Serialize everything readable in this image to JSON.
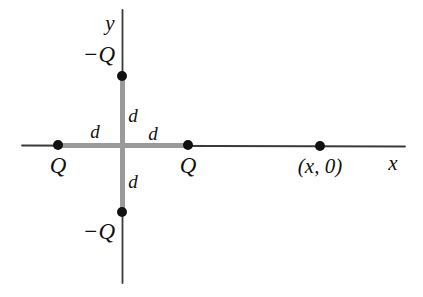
{
  "figure": {
    "type": "physics-diagram",
    "background_color": "#ffffff",
    "axis_color_thin": "#3a3a3a",
    "axis_color_thick": "#9a9a9a",
    "dot_color": "#111111",
    "label_color": "#111111"
  },
  "axes": {
    "x_label": "x",
    "y_label": "y",
    "x_axis_start_px": 22,
    "x_axis_end_px": 405,
    "y_axis_top_px": 10,
    "y_axis_bottom_px": 283,
    "origin_x_px": 122,
    "origin_y_px": 145
  },
  "charges": [
    {
      "id": "charge-left",
      "label": "Q",
      "sign": "positive",
      "x_px": 58,
      "y_px": 145,
      "label_x_px": 58,
      "label_y_px": 165,
      "position": "(-d, 0)"
    },
    {
      "id": "charge-right",
      "label": "Q",
      "sign": "positive",
      "x_px": 188,
      "y_px": 145,
      "label_x_px": 188,
      "label_y_px": 165,
      "position": "(d, 0)"
    },
    {
      "id": "charge-top",
      "label": "−Q",
      "sign": "negative",
      "x_px": 122,
      "y_px": 76,
      "label_x_px": 99,
      "label_y_px": 54,
      "position": "(0, d)"
    },
    {
      "id": "charge-bottom",
      "label": "−Q",
      "sign": "negative",
      "x_px": 122,
      "y_px": 212,
      "label_x_px": 99,
      "label_y_px": 231,
      "position": "(0, -d)"
    }
  ],
  "field_point": {
    "id": "field-point",
    "label": "(x, 0)",
    "x_px": 320,
    "y_px": 146,
    "label_x_px": 320,
    "label_y_px": 166
  },
  "distance_labels": [
    {
      "id": "d-left",
      "label": "d",
      "x_px": 95,
      "y_px": 131
    },
    {
      "id": "d-top",
      "label": "d",
      "x_px": 133,
      "y_px": 115
    },
    {
      "id": "d-right",
      "label": "d",
      "x_px": 153,
      "y_px": 133
    },
    {
      "id": "d-bottom",
      "label": "d",
      "x_px": 133,
      "y_px": 181
    }
  ],
  "thick_segments": [
    {
      "id": "seg-left",
      "from": [
        58,
        145
      ],
      "to": [
        122,
        145
      ]
    },
    {
      "id": "seg-right",
      "from": [
        122,
        145
      ],
      "to": [
        188,
        145
      ]
    },
    {
      "id": "seg-up",
      "from": [
        122,
        76
      ],
      "to": [
        122,
        145
      ]
    },
    {
      "id": "seg-down",
      "from": [
        122,
        145
      ],
      "to": [
        122,
        212
      ]
    }
  ]
}
